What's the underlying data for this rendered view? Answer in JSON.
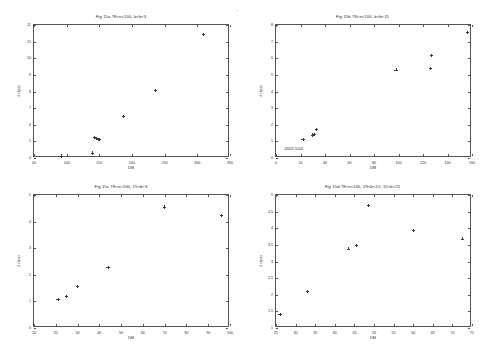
{
  "figure": {
    "background": "#ffffff",
    "marker_color": "#3a3a3a",
    "axis_color": "#555555",
    "layout": "2x2 grid of scatter panels"
  },
  "chart_data": [
    {
      "type": "scatter",
      "panel": "top-left",
      "title": "Fig 15a      78<n<100, b<b<3",
      "xlabel": "DM",
      "ylabel": "d (kpc)",
      "xlim": [
        50,
        350
      ],
      "ylim": [
        4,
        12
      ],
      "xticks": [
        50,
        100,
        150,
        200,
        250,
        300,
        350
      ],
      "yticks": [
        4,
        5,
        6,
        7,
        8,
        9,
        10,
        11,
        12
      ],
      "grid": false,
      "legend": "none",
      "x": [
        92,
        139,
        142,
        145,
        148,
        150,
        187,
        236,
        309
      ],
      "y": [
        4.12,
        4.3,
        5.22,
        5.18,
        5.1,
        5.12,
        6.5,
        8.05,
        11.45
      ]
    },
    {
      "type": "scatter",
      "panel": "top-right",
      "title": "Fig 15b      78<n<100, b<b<15",
      "xlabel": "DM",
      "ylabel": "d (kpc)",
      "xlim": [
        0,
        160
      ],
      "ylim": [
        0,
        8
      ],
      "xticks": [
        0,
        20,
        40,
        60,
        80,
        100,
        120,
        140,
        160
      ],
      "yticks": [
        0,
        1,
        2,
        3,
        4,
        5,
        6,
        7,
        8
      ],
      "grid": false,
      "legend": "none",
      "x": [
        22,
        30,
        31,
        33,
        98,
        126,
        127,
        156
      ],
      "y": [
        1.12,
        1.38,
        1.42,
        1.72,
        5.3,
        5.4,
        6.15,
        7.55
      ],
      "annotations": [
        {
          "text": "J2022-5104",
          "x": 11,
          "y": 0.48
        }
      ]
    },
    {
      "type": "scatter",
      "panel": "bottom-left",
      "title": "Fig 15c      78<n<100, 15<b<3",
      "xlabel": "DM",
      "ylabel": "d (kpc)",
      "xlim": [
        10,
        100
      ],
      "ylim": [
        0,
        5
      ],
      "xticks": [
        10,
        20,
        30,
        40,
        50,
        60,
        70,
        80,
        90,
        100
      ],
      "yticks": [
        0,
        1,
        2,
        3,
        4,
        5
      ],
      "grid": false,
      "legend": "none",
      "x": [
        21,
        25,
        30,
        44,
        70,
        96
      ],
      "y": [
        1.08,
        1.18,
        1.55,
        2.28,
        4.55,
        4.22
      ]
    },
    {
      "type": "scatter",
      "panel": "bottom-right",
      "title": "Fig 15d      78<n<100, 29<b<15, 15<b<25",
      "xlabel": "DM",
      "ylabel": "d (kpc)",
      "xlim": [
        25,
        75
      ],
      "ylim": [
        1,
        5
      ],
      "xticks": [
        25,
        30,
        35,
        40,
        45,
        50,
        55,
        60,
        65,
        70,
        75
      ],
      "yticks": [
        1,
        1.5,
        2,
        2.5,
        3,
        3.5,
        4,
        4.5,
        5
      ],
      "ytick_labels": [
        "1",
        "1.5",
        "2",
        "2.5",
        "3",
        "3.5",
        "4",
        "4.5",
        "5"
      ],
      "grid": false,
      "legend": "none",
      "x": [
        26,
        33,
        43.5,
        45.5,
        48.5,
        60,
        72.5
      ],
      "y": [
        1.4,
        2.1,
        3.38,
        3.48,
        4.68,
        3.93,
        3.68
      ]
    }
  ]
}
